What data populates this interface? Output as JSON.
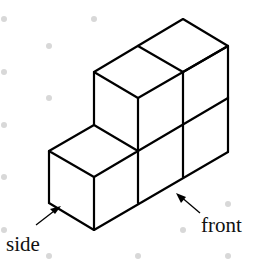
{
  "figure": {
    "labels": {
      "side": "side",
      "front": "front"
    },
    "cube_count": 5,
    "colors": {
      "edges": "#000000",
      "grid_dots": "#d8d8d8",
      "background": "#ffffff"
    }
  }
}
